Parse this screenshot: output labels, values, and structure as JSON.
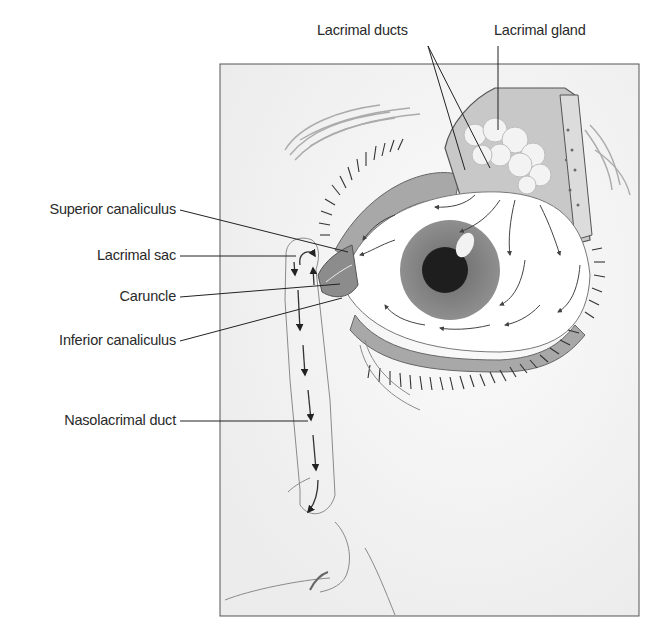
{
  "diagram": {
    "labels": {
      "lacrimal_ducts": "Lacrimal ducts",
      "lacrimal_gland": "Lacrimal gland",
      "superior_canaliculus": "Superior canaliculus",
      "lacrimal_sac": "Lacrimal sac",
      "caruncle": "Caruncle",
      "inferior_canaliculus": "Inferior canaliculus",
      "nasolacrimal_duct": "Nasolacrimal duct"
    },
    "colors": {
      "background": "#ffffff",
      "panel": "#f4f4f4",
      "panel_border": "#555555",
      "leader_line": "#222222",
      "sclera": "#ffffff",
      "iris": "#8a8a8a",
      "pupil": "#1e1e1e",
      "lid_tissue": "#a8a8a8",
      "gland": "#f0f0f0",
      "bone": "#dcdcdc"
    }
  }
}
